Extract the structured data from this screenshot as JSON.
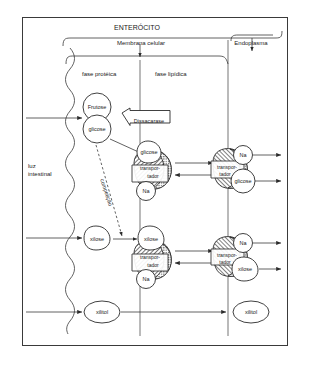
{
  "diagram": {
    "title": "ENTERÓCITO",
    "headers": {
      "membrane": "Membrana celular",
      "endoplasm": "Endoplasma",
      "protein_phase": "fase protéica",
      "lipid_phase": "fase lipídica"
    },
    "lumen_label_line1": "luz",
    "lumen_label_line2": "intestinal",
    "enzyme_label": "Dissacarase",
    "competition_label": "competição",
    "molecules": {
      "fructose": "Frutose",
      "glucose": "glicose",
      "xylose": "xilose",
      "xylitol": "xilitol",
      "sodium": "Na",
      "carrier_line1": "transpor-",
      "carrier_line2": "tador"
    },
    "rows": [
      {
        "name": "glucose-row",
        "lumen_molecule": "glicose",
        "membrane_molecule": "glicose",
        "carrier": "transportador",
        "cotransported_ion": "Na",
        "exported_ion": "Na",
        "exported_molecule": "glicose"
      },
      {
        "name": "xylose-row",
        "lumen_molecule": "xilose",
        "membrane_molecule": "xilose",
        "carrier": "transportador",
        "cotransported_ion": "Na",
        "exported_ion": "Na",
        "exported_molecule": "xilose"
      },
      {
        "name": "xylitol-row",
        "lumen_molecule": "xilitol",
        "exported_molecule": "xilitol"
      }
    ],
    "colors": {
      "ink": "#2b2b2b",
      "frame": "#3a3a3a",
      "background": "#ffffff"
    }
  }
}
